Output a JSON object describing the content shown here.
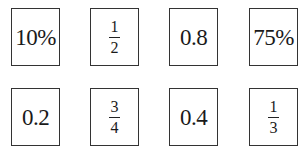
{
  "cards": [
    {
      "type": "text",
      "value": "10%"
    },
    {
      "type": "fraction",
      "numerator": "1",
      "denominator": "2"
    },
    {
      "type": "text",
      "value": "0.8"
    },
    {
      "type": "text",
      "value": "75%"
    },
    {
      "type": "text",
      "value": "0.2"
    },
    {
      "type": "fraction",
      "numerator": "3",
      "denominator": "4"
    },
    {
      "type": "text",
      "value": "0.4"
    },
    {
      "type": "fraction",
      "numerator": "1",
      "denominator": "3"
    }
  ]
}
